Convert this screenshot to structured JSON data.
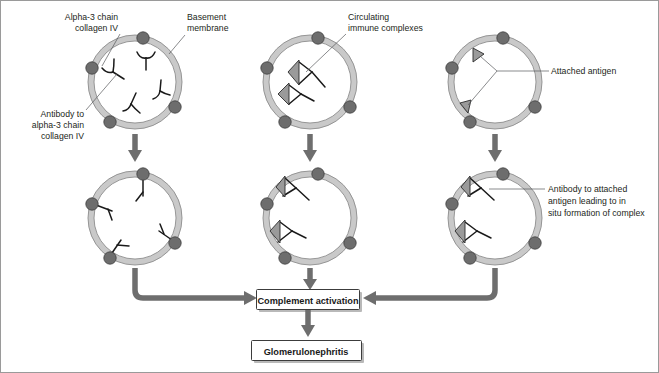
{
  "figure": {
    "frame_color": "#9a9a9a",
    "background": "#ffffff"
  },
  "palette": {
    "membrane": "#c9c9c9",
    "membrane_edge": "#8d8d8d",
    "antigen_dot": "#6d6d6d",
    "antibody": "#1a1a1a",
    "attached_antigen": "#9a9a9a",
    "arrow": "#6e6e6e",
    "box_border": "#3c3c3c",
    "text": "#231f20"
  },
  "labels": {
    "alpha3_collagen": {
      "lines": [
        "Alpha-3 chain",
        "collagen IV"
      ],
      "align": "right"
    },
    "basement_membrane": {
      "lines": [
        "Basement",
        "membrane"
      ],
      "align": "left"
    },
    "antibody_alpha3": {
      "lines": [
        "Antibody to",
        "alpha-3 chain",
        "collagen IV"
      ],
      "align": "right"
    },
    "circulating_complexes": {
      "lines": [
        "Circulating",
        "immune complexes"
      ],
      "align": "left"
    },
    "attached_antigen": {
      "lines": [
        "Attached antigen"
      ],
      "align": "left"
    },
    "antibody_attached": {
      "lines": [
        "Antibody to attached",
        "antigen leading to in",
        "situ formation of complex"
      ],
      "align": "left"
    }
  },
  "columns": [
    {
      "id": "anti-gbm",
      "top_cell": {
        "name": "glomerular-capillary-loop-top-left",
        "membrane_antigens": 4,
        "free_antibodies": 4,
        "attached_antigens": 0,
        "description": "Alpha-3 chain collagen IV antigens in basement membrane with free circulating antibody"
      },
      "bottom_cell": {
        "name": "glomerular-capillary-loop-bottom-left",
        "membrane_antigens": 4,
        "bound_antibodies": 4,
        "attached_antigens": 0,
        "description": "Antibody bound to alpha-3 chain collagen IV in basement membrane"
      }
    },
    {
      "id": "immune-complex",
      "top_cell": {
        "name": "glomerular-capillary-loop-top-middle",
        "membrane_antigens": 4,
        "free_antibodies": 0,
        "circulating_complexes": 2,
        "description": "Circulating immune complexes within the capillary lumen"
      },
      "bottom_cell": {
        "name": "glomerular-capillary-loop-bottom-middle",
        "membrane_antigens": 4,
        "deposited_complexes": 2,
        "description": "Immune complexes deposited along the basement membrane"
      }
    },
    {
      "id": "in-situ",
      "top_cell": {
        "name": "glomerular-capillary-loop-top-right",
        "membrane_antigens": 4,
        "attached_antigens": 2,
        "description": "Planted antigen attached to the basement membrane"
      },
      "bottom_cell": {
        "name": "glomerular-capillary-loop-bottom-right",
        "membrane_antigens": 4,
        "attached_antigens": 2,
        "bound_antibodies": 2,
        "description": "Antibody binds attached antigen forming complex in situ"
      }
    }
  ],
  "flow": {
    "complement_activation": "Complement activation",
    "outcome": "Glomerulonephritis"
  }
}
